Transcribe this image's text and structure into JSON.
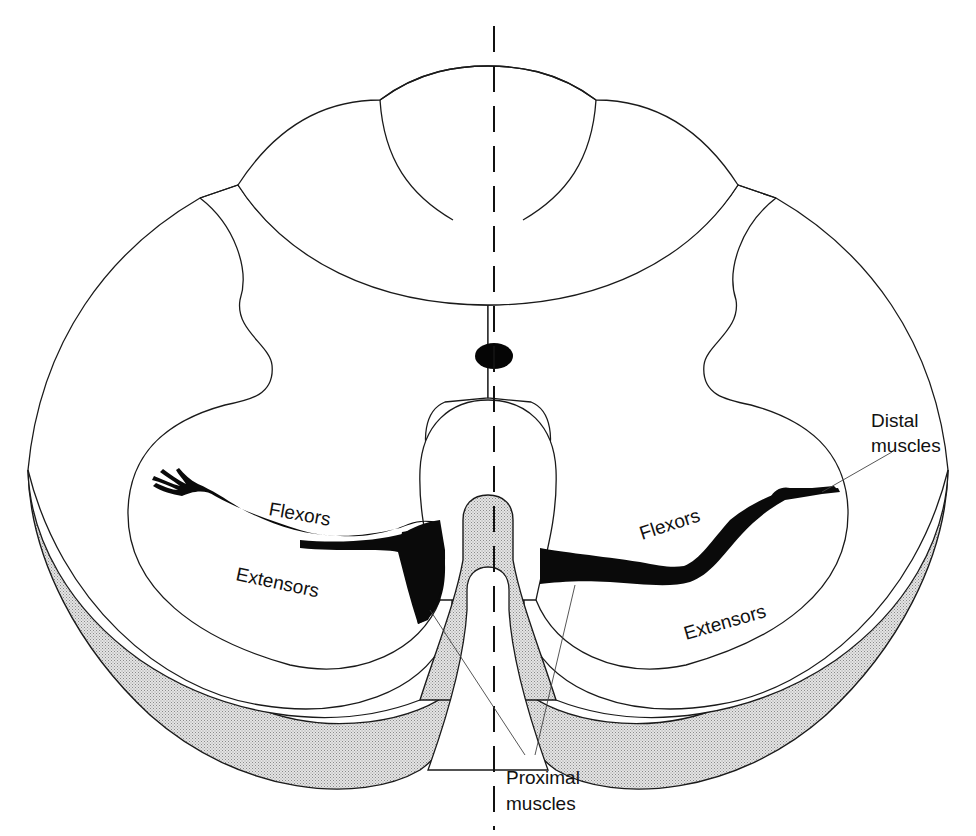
{
  "figure": {
    "type": "anatomical-diagram",
    "colors": {
      "line": "#1a1a1a",
      "silhouette": "#0a0a0a",
      "stipple": "#cfcfcf",
      "background": "#ffffff"
    }
  },
  "labels": {
    "flexors_left": "Flexors",
    "extensors_left": "Extensors",
    "flexors_right": "Flexors",
    "extensors_right": "Extensors",
    "distal_line1": "Distal",
    "distal_line2": "muscles",
    "proximal_line1": "Proximal",
    "proximal_line2": "muscles"
  }
}
